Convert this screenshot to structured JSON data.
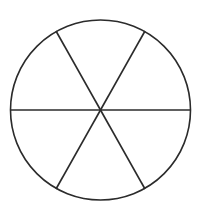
{
  "diagram": {
    "type": "circle-divided-into-equal-sectors",
    "sectors": 6,
    "stroke_color": "#2b2b2b",
    "background": "#ffffff",
    "circle": {
      "cx": 100.5,
      "cy": 110,
      "r": 90
    },
    "spokes": [
      {
        "x1": 10.5,
        "y1": 110,
        "x2": 190.5,
        "y2": 110
      },
      {
        "x1": 56,
        "y1": 31,
        "x2": 145,
        "y2": 189
      },
      {
        "x1": 145,
        "y1": 31,
        "x2": 56,
        "y2": 189
      }
    ]
  }
}
